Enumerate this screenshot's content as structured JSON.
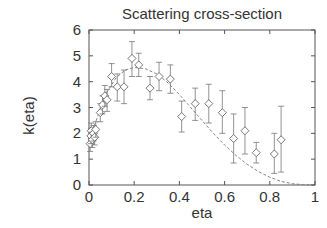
{
  "chart_data": {
    "type": "scatter",
    "title": "Scattering cross-section",
    "xlabel": "eta",
    "ylabel": "k(eta)",
    "xlim": [
      0,
      1
    ],
    "ylim": [
      0,
      6
    ],
    "xticks": [
      "0",
      "0.2",
      "0.4",
      "0.6",
      "0.8",
      "1"
    ],
    "yticks": [
      "0",
      "1",
      "2",
      "3",
      "4",
      "5",
      "6"
    ],
    "grid": false,
    "series": [
      {
        "name": "measurements",
        "marker": "diamond",
        "errorbars": true,
        "points": [
          {
            "x": 0.005,
            "y": 1.6,
            "lo": 1.3,
            "hi": 1.9
          },
          {
            "x": 0.008,
            "y": 1.9,
            "lo": 1.6,
            "hi": 2.2
          },
          {
            "x": 0.01,
            "y": 2.1,
            "lo": 1.8,
            "hi": 2.4
          },
          {
            "x": 0.015,
            "y": 1.75,
            "lo": 1.45,
            "hi": 2.05
          },
          {
            "x": 0.02,
            "y": 2.0,
            "lo": 1.7,
            "hi": 2.3
          },
          {
            "x": 0.025,
            "y": 1.85,
            "lo": 1.55,
            "hi": 2.15
          },
          {
            "x": 0.03,
            "y": 2.15,
            "lo": 1.85,
            "hi": 2.45
          },
          {
            "x": 0.05,
            "y": 2.8,
            "lo": 2.45,
            "hi": 3.15
          },
          {
            "x": 0.06,
            "y": 3.1,
            "lo": 2.75,
            "hi": 3.45
          },
          {
            "x": 0.07,
            "y": 3.45,
            "lo": 3.05,
            "hi": 3.85
          },
          {
            "x": 0.08,
            "y": 3.3,
            "lo": 2.85,
            "hi": 3.7
          },
          {
            "x": 0.1,
            "y": 4.2,
            "lo": 3.8,
            "hi": 4.7
          },
          {
            "x": 0.125,
            "y": 3.8,
            "lo": 3.25,
            "hi": 4.3
          },
          {
            "x": 0.155,
            "y": 3.8,
            "lo": 3.15,
            "hi": 4.45
          },
          {
            "x": 0.19,
            "y": 4.9,
            "lo": 4.2,
            "hi": 5.55
          },
          {
            "x": 0.22,
            "y": 4.65,
            "lo": 4.2,
            "hi": 5.1
          },
          {
            "x": 0.27,
            "y": 3.75,
            "lo": 3.3,
            "hi": 4.2
          },
          {
            "x": 0.31,
            "y": 4.2,
            "lo": 3.65,
            "hi": 4.75
          },
          {
            "x": 0.36,
            "y": 4.1,
            "lo": 3.55,
            "hi": 4.65
          },
          {
            "x": 0.41,
            "y": 2.65,
            "lo": 2.05,
            "hi": 3.25
          },
          {
            "x": 0.47,
            "y": 3.15,
            "lo": 2.5,
            "hi": 3.75
          },
          {
            "x": 0.53,
            "y": 3.15,
            "lo": 2.4,
            "hi": 3.9
          },
          {
            "x": 0.59,
            "y": 2.8,
            "lo": 2.0,
            "hi": 3.65
          },
          {
            "x": 0.64,
            "y": 1.8,
            "lo": 0.85,
            "hi": 2.75
          },
          {
            "x": 0.69,
            "y": 2.1,
            "lo": 1.2,
            "hi": 3.0
          },
          {
            "x": 0.74,
            "y": 1.25,
            "lo": 0.85,
            "hi": 1.65
          },
          {
            "x": 0.82,
            "y": 1.2,
            "lo": 0.45,
            "hi": 2.0
          },
          {
            "x": 0.85,
            "y": 1.75,
            "lo": 0.5,
            "hi": 3.05
          }
        ]
      },
      {
        "name": "fit",
        "style": "dashed",
        "points": [
          {
            "x": 0.0,
            "y": 1.55
          },
          {
            "x": 0.02,
            "y": 2.2
          },
          {
            "x": 0.05,
            "y": 2.95
          },
          {
            "x": 0.08,
            "y": 3.6
          },
          {
            "x": 0.12,
            "y": 4.15
          },
          {
            "x": 0.16,
            "y": 4.45
          },
          {
            "x": 0.2,
            "y": 4.55
          },
          {
            "x": 0.25,
            "y": 4.5
          },
          {
            "x": 0.3,
            "y": 4.3
          },
          {
            "x": 0.35,
            "y": 3.95
          },
          {
            "x": 0.4,
            "y": 3.5
          },
          {
            "x": 0.45,
            "y": 3.0
          },
          {
            "x": 0.5,
            "y": 2.5
          },
          {
            "x": 0.55,
            "y": 2.0
          },
          {
            "x": 0.6,
            "y": 1.55
          },
          {
            "x": 0.65,
            "y": 1.15
          },
          {
            "x": 0.7,
            "y": 0.8
          },
          {
            "x": 0.75,
            "y": 0.52
          },
          {
            "x": 0.8,
            "y": 0.3
          },
          {
            "x": 0.85,
            "y": 0.14
          },
          {
            "x": 0.9,
            "y": 0.05
          },
          {
            "x": 0.95,
            "y": 0.01
          },
          {
            "x": 1.0,
            "y": 0.0
          }
        ]
      }
    ]
  }
}
